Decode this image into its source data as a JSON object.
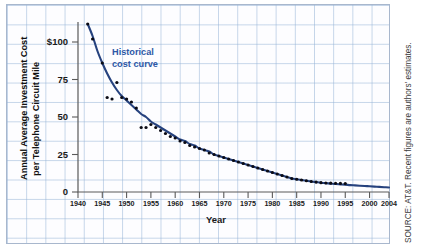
{
  "figure": {
    "title": "",
    "annotation": {
      "line1": "Historical",
      "line2": "cost curve"
    },
    "source_note": "SOURCE: AT&T. Recent figures are authors' estimates.",
    "colors": {
      "curve": "#26427e",
      "dots": "#0b0b14",
      "annotation": "#2d58a6",
      "grid": "#96b4d7",
      "axis": "#5a5a5a",
      "paper": "#fdfdff"
    }
  },
  "chart_data": {
    "type": "line",
    "title": "",
    "subtitle": "",
    "xlabel": "Year",
    "ylabel": "Annual Average Investment Cost per Telephone Circuit Mile",
    "ylabel_line1": "Annual Average Investment Cost",
    "ylabel_line2": "per Telephone Circuit Mile",
    "xlim": [
      1940,
      2004
    ],
    "ylim": [
      0,
      115
    ],
    "xticks": [
      1940,
      1945,
      1950,
      1955,
      1960,
      1965,
      1970,
      1975,
      1980,
      1985,
      1990,
      1995,
      2000,
      2004
    ],
    "xticklabels": [
      "1940",
      "1945",
      "1950",
      "1955",
      "1960",
      "1965",
      "1970",
      "1975",
      "1980",
      "1985",
      "1990",
      "1995",
      "2000",
      "2004"
    ],
    "yticks": [
      0,
      25,
      50,
      75,
      100
    ],
    "yticklabels": [
      "0",
      "25",
      "50",
      "75",
      "$100"
    ],
    "grid": true,
    "grid_style": "graph-paper",
    "legend": null,
    "legend_position": "none",
    "annotations": [
      {
        "text": "Historical cost curve",
        "x": 1952,
        "y": 92,
        "color": "#2d58a6"
      }
    ],
    "series": [
      {
        "name": "Historical cost curve",
        "type": "line",
        "color": "#26427e",
        "points": [
          [
            1942,
            112
          ],
          [
            1943,
            104
          ],
          [
            1944,
            94
          ],
          [
            1945,
            86
          ],
          [
            1946,
            79
          ],
          [
            1947,
            73
          ],
          [
            1948,
            68
          ],
          [
            1949,
            64
          ],
          [
            1950,
            61
          ],
          [
            1951,
            58
          ],
          [
            1952,
            55
          ],
          [
            1953,
            52
          ],
          [
            1954,
            50
          ],
          [
            1955,
            47
          ],
          [
            1956,
            45
          ],
          [
            1957,
            43
          ],
          [
            1958,
            41
          ],
          [
            1959,
            39
          ],
          [
            1960,
            37
          ],
          [
            1961,
            35
          ],
          [
            1962,
            34
          ],
          [
            1963,
            32
          ],
          [
            1964,
            31
          ],
          [
            1965,
            29
          ],
          [
            1966,
            28
          ],
          [
            1967,
            27
          ],
          [
            1968,
            25
          ],
          [
            1969,
            24
          ],
          [
            1970,
            23
          ],
          [
            1971,
            22
          ],
          [
            1972,
            21
          ],
          [
            1973,
            20
          ],
          [
            1974,
            19
          ],
          [
            1975,
            18
          ],
          [
            1976,
            17
          ],
          [
            1977,
            16
          ],
          [
            1978,
            15
          ],
          [
            1979,
            14
          ],
          [
            1980,
            13
          ],
          [
            1981,
            12
          ],
          [
            1982,
            11
          ],
          [
            1983,
            10
          ],
          [
            1984,
            9
          ],
          [
            1985,
            8.5
          ],
          [
            1986,
            8
          ],
          [
            1987,
            7.5
          ],
          [
            1988,
            7
          ],
          [
            1989,
            6.6
          ],
          [
            1990,
            6.2
          ],
          [
            1991,
            5.9
          ],
          [
            1992,
            5.6
          ],
          [
            1993,
            5.3
          ],
          [
            1994,
            5.1
          ],
          [
            1995,
            4.9
          ],
          [
            1996,
            4.6
          ],
          [
            1997,
            4.4
          ],
          [
            1998,
            4.2
          ],
          [
            1999,
            4.0
          ],
          [
            2000,
            3.8
          ],
          [
            2001,
            3.6
          ],
          [
            2002,
            3.4
          ],
          [
            2003,
            3.2
          ],
          [
            2004,
            3.0
          ]
        ]
      },
      {
        "name": "Observed data points",
        "type": "scatter",
        "color": "#0b0b14",
        "points": [
          [
            1942,
            112
          ],
          [
            1943,
            102
          ],
          [
            1945,
            86
          ],
          [
            1946,
            63
          ],
          [
            1947,
            62
          ],
          [
            1948,
            73
          ],
          [
            1949,
            63
          ],
          [
            1950,
            62
          ],
          [
            1951,
            60
          ],
          [
            1952,
            56
          ],
          [
            1953,
            43
          ],
          [
            1954,
            43
          ],
          [
            1955,
            45
          ],
          [
            1956,
            43
          ],
          [
            1957,
            41
          ],
          [
            1958,
            39
          ],
          [
            1959,
            37
          ],
          [
            1960,
            36
          ],
          [
            1961,
            34
          ],
          [
            1962,
            33
          ],
          [
            1963,
            31
          ],
          [
            1964,
            30
          ],
          [
            1965,
            29
          ],
          [
            1966,
            28
          ],
          [
            1967,
            26
          ],
          [
            1968,
            25
          ],
          [
            1969,
            24
          ],
          [
            1970,
            23
          ],
          [
            1971,
            22
          ],
          [
            1972,
            21
          ],
          [
            1973,
            20
          ],
          [
            1974,
            19
          ],
          [
            1975,
            18
          ],
          [
            1976,
            17
          ],
          [
            1977,
            16
          ],
          [
            1978,
            15
          ],
          [
            1979,
            14
          ],
          [
            1980,
            13
          ],
          [
            1981,
            12
          ],
          [
            1982,
            11
          ],
          [
            1983,
            10
          ],
          [
            1984,
            9
          ],
          [
            1985,
            8.5
          ],
          [
            1986,
            8
          ],
          [
            1987,
            7.5
          ],
          [
            1988,
            7
          ],
          [
            1989,
            6.6
          ],
          [
            1990,
            6.2
          ],
          [
            1991,
            6.0
          ],
          [
            1992,
            5.9
          ],
          [
            1993,
            5.8
          ],
          [
            1994,
            5.7
          ],
          [
            1995,
            5.6
          ]
        ]
      }
    ]
  }
}
